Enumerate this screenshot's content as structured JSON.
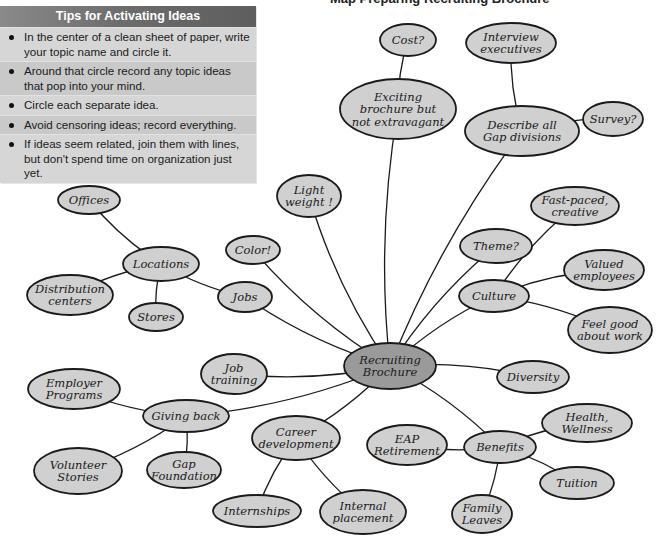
{
  "caption": "Map Preparing Recruiting Brochure",
  "tips": {
    "title": "Tips for Activating Ideas",
    "items": [
      "In the center of a clean sheet of paper, write your topic name and circle it.",
      "Around that circle record any topic ideas that pop into your mind.",
      "Circle each separate idea.",
      "Avoid censoring ideas; record everything.",
      "If ideas seem related, join them with lines, but don't spend time on organization just yet."
    ]
  },
  "colors": {
    "node_fill": "#d0d0d0",
    "center_fill": "#9a9a9a",
    "stroke": "#1a1a1a",
    "tips_bg": "#cfcfcf",
    "tips_header": "#6b6b6b"
  },
  "mindmap": {
    "center": {
      "id": "recruiting",
      "lines": [
        "Recruiting",
        "Brochure"
      ],
      "x": 390,
      "y": 366,
      "rx": 46,
      "ry": 23
    },
    "nodes": [
      {
        "id": "cost",
        "lines": [
          "Cost?"
        ],
        "x": 408,
        "y": 40,
        "rx": 28,
        "ry": 16
      },
      {
        "id": "interview",
        "lines": [
          "Interview",
          "executives"
        ],
        "x": 511,
        "y": 43,
        "rx": 45,
        "ry": 20
      },
      {
        "id": "exciting",
        "lines": [
          "Exciting",
          "brochure but",
          "not extravagant"
        ],
        "x": 398,
        "y": 109,
        "rx": 58,
        "ry": 30
      },
      {
        "id": "survey",
        "lines": [
          "Survey?"
        ],
        "x": 613,
        "y": 119,
        "rx": 30,
        "ry": 17
      },
      {
        "id": "describe",
        "lines": [
          "Describe all",
          "Gap divisions"
        ],
        "x": 522,
        "y": 131,
        "rx": 57,
        "ry": 25
      },
      {
        "id": "offices",
        "lines": [
          "Offices"
        ],
        "x": 89,
        "y": 200,
        "rx": 31,
        "ry": 14
      },
      {
        "id": "light",
        "lines": [
          "Light",
          "weight !"
        ],
        "x": 309,
        "y": 196,
        "rx": 32,
        "ry": 21
      },
      {
        "id": "fastpaced",
        "lines": [
          "Fast-paced,",
          "creative"
        ],
        "x": 575,
        "y": 206,
        "rx": 44,
        "ry": 19
      },
      {
        "id": "color",
        "lines": [
          "Color!"
        ],
        "x": 253,
        "y": 250,
        "rx": 27,
        "ry": 14
      },
      {
        "id": "locations",
        "lines": [
          "Locations"
        ],
        "x": 161,
        "y": 264,
        "rx": 38,
        "ry": 17
      },
      {
        "id": "theme",
        "lines": [
          "Theme?"
        ],
        "x": 496,
        "y": 246,
        "rx": 36,
        "ry": 17
      },
      {
        "id": "valued",
        "lines": [
          "Valued",
          "employees"
        ],
        "x": 604,
        "y": 270,
        "rx": 40,
        "ry": 20
      },
      {
        "id": "distribution",
        "lines": [
          "Distribution",
          "centers"
        ],
        "x": 70,
        "y": 295,
        "rx": 43,
        "ry": 20
      },
      {
        "id": "jobs",
        "lines": [
          "Jobs"
        ],
        "x": 245,
        "y": 297,
        "rx": 27,
        "ry": 15
      },
      {
        "id": "culture",
        "lines": [
          "Culture"
        ],
        "x": 494,
        "y": 296,
        "rx": 35,
        "ry": 16
      },
      {
        "id": "stores",
        "lines": [
          "Stores"
        ],
        "x": 156,
        "y": 317,
        "rx": 27,
        "ry": 14
      },
      {
        "id": "feelgood",
        "lines": [
          "Feel good",
          "about work"
        ],
        "x": 610,
        "y": 330,
        "rx": 42,
        "ry": 23
      },
      {
        "id": "jobtraining",
        "lines": [
          "Job",
          "training"
        ],
        "x": 234,
        "y": 374,
        "rx": 33,
        "ry": 20
      },
      {
        "id": "diversity",
        "lines": [
          "Diversity"
        ],
        "x": 533,
        "y": 377,
        "rx": 36,
        "ry": 16
      },
      {
        "id": "employer",
        "lines": [
          "Employer",
          "Programs"
        ],
        "x": 74,
        "y": 389,
        "rx": 46,
        "ry": 20
      },
      {
        "id": "giving",
        "lines": [
          "Giving back"
        ],
        "x": 186,
        "y": 416,
        "rx": 43,
        "ry": 16
      },
      {
        "id": "health",
        "lines": [
          "Health,",
          "Wellness"
        ],
        "x": 587,
        "y": 423,
        "rx": 45,
        "ry": 19
      },
      {
        "id": "career",
        "lines": [
          "Career",
          "development"
        ],
        "x": 296,
        "y": 438,
        "rx": 44,
        "ry": 22
      },
      {
        "id": "eap",
        "lines": [
          "EAP",
          "Retirement"
        ],
        "x": 407,
        "y": 445,
        "rx": 40,
        "ry": 20
      },
      {
        "id": "benefits",
        "lines": [
          "Benefits"
        ],
        "x": 500,
        "y": 447,
        "rx": 36,
        "ry": 16
      },
      {
        "id": "gapfoundation",
        "lines": [
          "Gap",
          "Foundation"
        ],
        "x": 184,
        "y": 470,
        "rx": 37,
        "ry": 18
      },
      {
        "id": "volunteer",
        "lines": [
          "Volunteer",
          "Stories"
        ],
        "x": 78,
        "y": 471,
        "rx": 44,
        "ry": 23
      },
      {
        "id": "tuition",
        "lines": [
          "Tuition"
        ],
        "x": 577,
        "y": 483,
        "rx": 37,
        "ry": 16
      },
      {
        "id": "internships",
        "lines": [
          "Internships"
        ],
        "x": 257,
        "y": 511,
        "rx": 44,
        "ry": 16
      },
      {
        "id": "internal",
        "lines": [
          "Internal",
          "placement"
        ],
        "x": 363,
        "y": 512,
        "rx": 43,
        "ry": 22
      },
      {
        "id": "family",
        "lines": [
          "Family",
          "Leaves"
        ],
        "x": 482,
        "y": 514,
        "rx": 30,
        "ry": 19
      }
    ],
    "edges": [
      [
        "cost",
        "exciting"
      ],
      [
        "exciting",
        "recruiting"
      ],
      [
        "interview",
        "describe"
      ],
      [
        "survey",
        "describe"
      ],
      [
        "describe",
        "recruiting"
      ],
      [
        "light",
        "recruiting"
      ],
      [
        "color",
        "recruiting"
      ],
      [
        "jobs",
        "recruiting"
      ],
      [
        "offices",
        "locations"
      ],
      [
        "locations",
        "distribution"
      ],
      [
        "locations",
        "stores"
      ],
      [
        "locations",
        "jobs"
      ],
      [
        "theme",
        "recruiting"
      ],
      [
        "culture",
        "recruiting"
      ],
      [
        "fastpaced",
        "culture"
      ],
      [
        "valued",
        "culture"
      ],
      [
        "feelgood",
        "culture"
      ],
      [
        "jobtraining",
        "recruiting"
      ],
      [
        "diversity",
        "recruiting"
      ],
      [
        "giving",
        "recruiting"
      ],
      [
        "employer",
        "giving"
      ],
      [
        "volunteer",
        "giving"
      ],
      [
        "gapfoundation",
        "giving"
      ],
      [
        "career",
        "recruiting"
      ],
      [
        "career",
        "internships"
      ],
      [
        "career",
        "internal"
      ],
      [
        "benefits",
        "recruiting"
      ],
      [
        "eap",
        "benefits"
      ],
      [
        "health",
        "benefits"
      ],
      [
        "tuition",
        "benefits"
      ],
      [
        "family",
        "benefits"
      ]
    ]
  }
}
